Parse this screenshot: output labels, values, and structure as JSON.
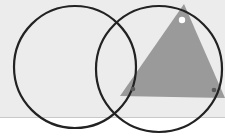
{
  "colors": {
    "panel": "#ececec",
    "divider": "#c8c8c8",
    "page": "#ffffff",
    "circle_stroke": "#222222",
    "triangle_fill": "#9a9a9a",
    "vertex_dot": "#5a5a5a",
    "vertex_dot_open": "#ffffff"
  },
  "diagram": {
    "circles": [
      {
        "name": "left-circle",
        "cx": 75,
        "cy": 67,
        "r": 61
      },
      {
        "name": "right-circle",
        "cx": 159,
        "cy": 69,
        "r": 63
      }
    ],
    "triangle": {
      "points": [
        [
          184,
          4
        ],
        [
          120,
          96
        ],
        [
          225,
          98
        ]
      ]
    },
    "vertices": [
      {
        "name": "top-vertex",
        "x": 182,
        "y": 20,
        "type": "open"
      },
      {
        "name": "left-vertex",
        "x": 133,
        "y": 89,
        "type": "filled"
      },
      {
        "name": "right-vertex",
        "x": 214,
        "y": 90,
        "type": "filled"
      }
    ]
  }
}
